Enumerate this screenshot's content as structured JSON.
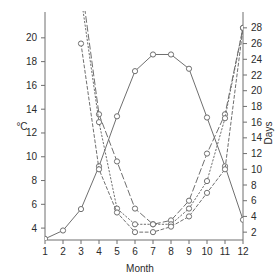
{
  "chart_data": {
    "type": "line",
    "title": "",
    "xlabel": "Month",
    "ylabel": "°C",
    "y2label": "Days",
    "grid": false,
    "legend": "none",
    "x": [
      1,
      2,
      3,
      4,
      5,
      6,
      7,
      8,
      9,
      10,
      11,
      12
    ],
    "xtick_labels": [
      "1",
      "2",
      "3",
      "4",
      "5",
      "6",
      "7",
      "8",
      "9",
      "10",
      "11",
      "12"
    ],
    "ylim": [
      3,
      21.5
    ],
    "ytick_labels": [
      "4",
      "6",
      "8",
      "10",
      "12",
      "14",
      "16",
      "18",
      "20"
    ],
    "yticks": [
      4,
      6,
      8,
      10,
      12,
      14,
      16,
      18,
      20
    ],
    "y2lim": [
      1,
      29
    ],
    "y2tick_labels": [
      "2",
      "4",
      "6",
      "8",
      "10",
      "12",
      "14",
      "16",
      "18",
      "20",
      "22",
      "24",
      "26",
      "28"
    ],
    "y2ticks": [
      2,
      4,
      6,
      8,
      10,
      12,
      14,
      16,
      18,
      20,
      22,
      24,
      26,
      28
    ],
    "series": [
      {
        "name": "temperature",
        "axis": "left",
        "style": "solid",
        "marker": "open-circle",
        "values": [
          3.1,
          3.8,
          5.6,
          9.2,
          13.4,
          17.2,
          18.6,
          18.6,
          17.4,
          13.3,
          9.2,
          4.7
        ]
      },
      {
        "name": "days-long-dash",
        "axis": "right",
        "style": "long-dash",
        "marker": "open-circle",
        "values": [
          null,
          null,
          34,
          17,
          11,
          5,
          3,
          3.5,
          6,
          12,
          17,
          28
        ]
      },
      {
        "name": "days-dotted",
        "axis": "right",
        "style": "dotted",
        "marker": "open-circle",
        "values": [
          null,
          null,
          32,
          16,
          5,
          3,
          3,
          3,
          5,
          8.5,
          16.5,
          28
        ]
      },
      {
        "name": "days-short-dash",
        "axis": "right",
        "style": "short-dash",
        "marker": "open-circle",
        "values": [
          null,
          null,
          26,
          10,
          4.5,
          2,
          2,
          2.7,
          4,
          7,
          10,
          28
        ]
      }
    ],
    "colors": {
      "line": "#6f6f6f",
      "axis": "#6f6f6f",
      "text": "#2b2b2b",
      "background": "#ffffff"
    }
  }
}
